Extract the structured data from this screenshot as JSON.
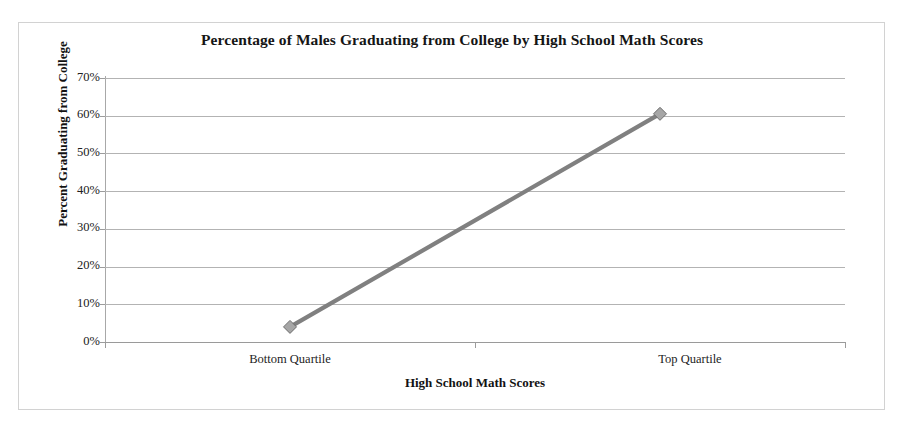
{
  "figure": {
    "title": "Percentage of Males Graduating from College by High School Math Scores",
    "background_color": "#ffffff",
    "frame_color": "#d2d2d2"
  },
  "chart_data": {
    "type": "line",
    "title": "Percentage of Males Graduating from College by High School Math Scores",
    "xlabel": "High School Math Scores",
    "ylabel": "Percent Graduating from College",
    "categories": [
      "Bottom Quartile",
      "Top Quartile"
    ],
    "values": [
      4,
      60.5
    ],
    "series": [
      {
        "name": "Percent Graduating from College",
        "values": [
          4,
          60.5
        ]
      }
    ],
    "ylim": [
      0,
      70
    ],
    "ytick_values": [
      0,
      10,
      20,
      30,
      40,
      50,
      60,
      70
    ],
    "ytick_labels": [
      "0%",
      "10%",
      "20%",
      "30%",
      "40%",
      "50%",
      "60%",
      "70%"
    ],
    "xtick_labels": [
      "Bottom Quartile",
      "Top Quartile"
    ],
    "grid": "horizontal",
    "legend": "none",
    "line_color": "#808080",
    "marker": "diamond",
    "marker_color": "#a6a6a6",
    "marker_edge_color": "#6e6e6e"
  }
}
